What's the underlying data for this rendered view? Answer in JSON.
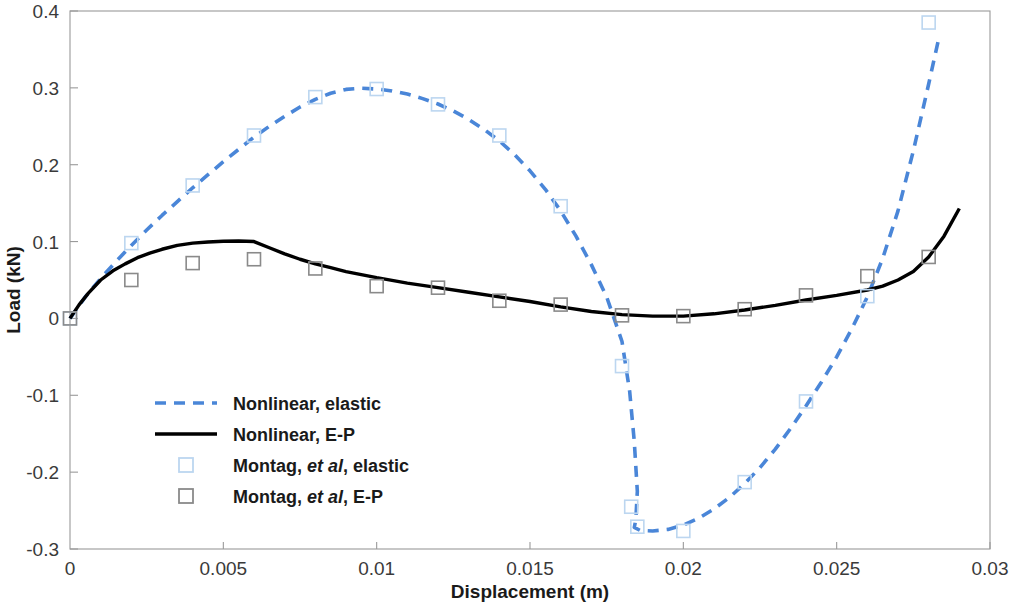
{
  "chart_data": {
    "type": "line",
    "title": "",
    "xlabel": "Displacement (m)",
    "ylabel": "Load (kN)",
    "xlim": [
      0,
      0.03
    ],
    "ylim": [
      -0.3,
      0.4
    ],
    "xticks": [
      "0",
      "0.005",
      "0.01",
      "0.015",
      "0.02",
      "0.025",
      "0.03"
    ],
    "xtick_values": [
      0,
      0.005,
      0.01,
      0.015,
      0.02,
      0.025,
      0.03
    ],
    "yticks": [
      "0.4",
      "0.3",
      "0.2",
      "0.1",
      "0",
      "-0.1",
      "-0.2",
      "-0.3"
    ],
    "ytick_values": [
      0.4,
      0.3,
      0.2,
      0.1,
      0,
      -0.1,
      -0.2,
      -0.3
    ],
    "grid": false,
    "legend_position": "center-left",
    "colors": {
      "nonlinear_elastic": "#4a86d8",
      "nonlinear_ep": "#000000",
      "montag_elastic_marker": "#bcd6f0",
      "montag_ep_marker": "#8a8a8a"
    },
    "series": [
      {
        "name": "Nonlinear, elastic",
        "style": "dashed",
        "color": "#4a86d8",
        "x": [
          0,
          0.0005,
          0.001,
          0.0015,
          0.002,
          0.0025,
          0.003,
          0.0035,
          0.004,
          0.0045,
          0.005,
          0.0055,
          0.006,
          0.0065,
          0.007,
          0.0075,
          0.008,
          0.0085,
          0.009,
          0.0095,
          0.01,
          0.0105,
          0.011,
          0.0115,
          0.012,
          0.0125,
          0.013,
          0.0135,
          0.014,
          0.0145,
          0.015,
          0.0155,
          0.016,
          0.0165,
          0.017,
          0.0175,
          0.018,
          0.01825,
          0.0184,
          0.0185,
          0.01845,
          0.0184,
          0.0186,
          0.019,
          0.0195,
          0.02,
          0.0205,
          0.021,
          0.0215,
          0.022,
          0.0225,
          0.023,
          0.0235,
          0.024,
          0.0245,
          0.025,
          0.0255,
          0.026,
          0.0265,
          0.027,
          0.0275,
          0.028,
          0.02835
        ],
        "y": [
          0,
          0.028,
          0.052,
          0.074,
          0.095,
          0.115,
          0.134,
          0.152,
          0.17,
          0.187,
          0.204,
          0.22,
          0.236,
          0.25,
          0.263,
          0.275,
          0.285,
          0.293,
          0.298,
          0.2995,
          0.2985,
          0.296,
          0.292,
          0.286,
          0.279,
          0.27,
          0.259,
          0.246,
          0.231,
          0.213,
          0.192,
          0.168,
          0.14,
          0.107,
          0.07,
          0.028,
          -0.03,
          -0.095,
          -0.16,
          -0.225,
          -0.262,
          -0.272,
          -0.276,
          -0.2765,
          -0.2745,
          -0.269,
          -0.26,
          -0.248,
          -0.233,
          -0.215,
          -0.194,
          -0.17,
          -0.143,
          -0.114,
          -0.083,
          -0.05,
          -0.013,
          0.028,
          0.078,
          0.14,
          0.218,
          0.305,
          0.368
        ]
      },
      {
        "name": "Nonlinear, E-P",
        "style": "solid",
        "color": "#000000",
        "x": [
          0,
          0.0003,
          0.0006,
          0.001,
          0.0014,
          0.0018,
          0.0022,
          0.0026,
          0.003,
          0.0035,
          0.004,
          0.0045,
          0.005,
          0.0055,
          0.006,
          0.0065,
          0.007,
          0.0075,
          0.008,
          0.0085,
          0.009,
          0.0095,
          0.01,
          0.011,
          0.012,
          0.013,
          0.014,
          0.015,
          0.016,
          0.017,
          0.018,
          0.019,
          0.02,
          0.021,
          0.022,
          0.023,
          0.024,
          0.025,
          0.026,
          0.0265,
          0.027,
          0.0275,
          0.028,
          0.0285,
          0.029
        ],
        "y": [
          0,
          0.018,
          0.033,
          0.05,
          0.062,
          0.071,
          0.079,
          0.085,
          0.09,
          0.095,
          0.098,
          0.0995,
          0.1005,
          0.1008,
          0.1,
          0.092,
          0.084,
          0.077,
          0.071,
          0.066,
          0.061,
          0.057,
          0.053,
          0.046,
          0.04,
          0.034,
          0.028,
          0.022,
          0.015,
          0.009,
          0.005,
          0.003,
          0.003,
          0.006,
          0.011,
          0.017,
          0.024,
          0.03,
          0.037,
          0.042,
          0.05,
          0.061,
          0.08,
          0.107,
          0.143
        ]
      },
      {
        "name": "Montag, et al, elastic",
        "style": "marker",
        "marker": "open-square",
        "color": "#bcd6f0",
        "x": [
          0,
          0.002,
          0.004,
          0.006,
          0.008,
          0.01,
          0.012,
          0.014,
          0.016,
          0.018,
          0.0183,
          0.0185,
          0.02,
          0.022,
          0.024,
          0.026,
          0.028
        ],
        "y": [
          0,
          0.098,
          0.173,
          0.238,
          0.288,
          0.2985,
          0.2785,
          0.238,
          0.146,
          -0.062,
          -0.245,
          -0.271,
          -0.2765,
          -0.213,
          -0.108,
          0.029,
          0.385
        ]
      },
      {
        "name": "Montag, et al, E-P",
        "style": "marker",
        "marker": "open-square",
        "color": "#8a8a8a",
        "x": [
          0,
          0.002,
          0.004,
          0.006,
          0.008,
          0.01,
          0.012,
          0.014,
          0.016,
          0.018,
          0.02,
          0.022,
          0.024,
          0.026,
          0.028
        ],
        "y": [
          0,
          0.05,
          0.072,
          0.077,
          0.065,
          0.042,
          0.04,
          0.023,
          0.018,
          0.004,
          0.003,
          0.012,
          0.03,
          0.055,
          0.08
        ]
      }
    ],
    "legend_entries": [
      {
        "label": "Nonlinear, elastic",
        "swatch": "dashed-line",
        "color": "#4a86d8"
      },
      {
        "label": "Nonlinear, E-P",
        "swatch": "solid-line",
        "color": "#000000"
      },
      {
        "label_pre": "Montag, ",
        "label_italic": "et al",
        "label_post": ", elastic",
        "swatch": "open-square",
        "color": "#bcd6f0"
      },
      {
        "label_pre": "Montag, ",
        "label_italic": "et al",
        "label_post": ", E-P",
        "swatch": "open-square",
        "color": "#8a8a8a"
      }
    ]
  }
}
